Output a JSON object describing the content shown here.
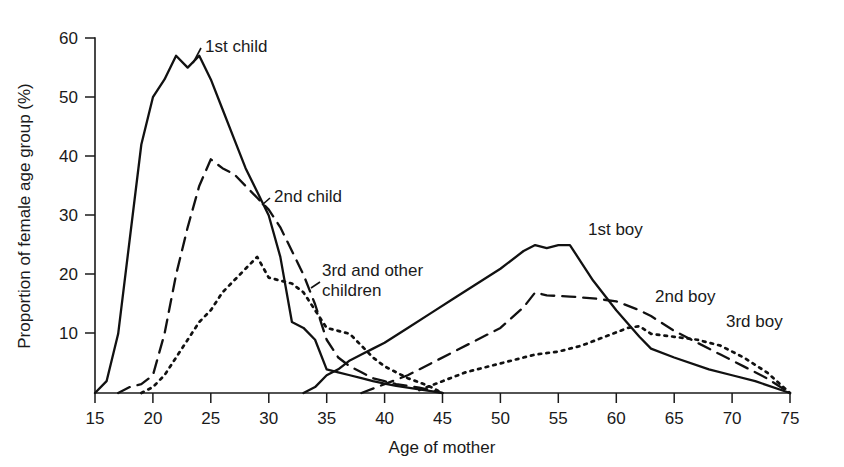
{
  "figure": {
    "background_color": "#ffffff",
    "ink_color": "#111111"
  },
  "axes": {
    "x_title": "Age of mother",
    "y_title": "Proportion of female age group (%)",
    "x_ticks": [
      "15",
      "20",
      "25",
      "30",
      "35",
      "40",
      "45",
      "50",
      "55",
      "60",
      "65",
      "70",
      "75"
    ],
    "y_ticks": [
      "10",
      "20",
      "30",
      "40",
      "50",
      "60"
    ]
  },
  "labels": {
    "first_child": "1st child",
    "second_child": "2nd child",
    "third_children_line1": "3rd and other",
    "third_children_line2": "children",
    "first_boy": "1st boy",
    "second_boy": "2nd boy",
    "third_boy": "3rd boy"
  },
  "chart_data": {
    "type": "line",
    "title": "",
    "xlabel": "Age of mother",
    "ylabel": "Proportion of female age group (%)",
    "xlim": [
      15,
      75
    ],
    "ylim": [
      0,
      60
    ],
    "xticks": [
      15,
      20,
      25,
      30,
      35,
      40,
      45,
      50,
      55,
      60,
      65,
      70,
      75
    ],
    "yticks": [
      10,
      20,
      30,
      40,
      50,
      60
    ],
    "grid": false,
    "legend_position": "inline-annotations",
    "series": [
      {
        "name": "1st child",
        "style": "solid",
        "x": [
          15,
          16,
          17,
          18,
          19,
          20,
          21,
          22,
          23,
          24,
          25,
          26,
          27,
          28,
          29,
          30,
          31,
          32,
          33,
          34,
          35,
          36,
          37,
          38,
          39,
          40,
          41,
          42,
          43,
          44,
          45
        ],
        "y": [
          0,
          2,
          10,
          26,
          42,
          50,
          53,
          57,
          55,
          57,
          53,
          48,
          43,
          38,
          34,
          30,
          23,
          12,
          11,
          9,
          4,
          3.5,
          3,
          2.5,
          2,
          1.6,
          1.2,
          0.9,
          0.6,
          0.3,
          0
        ]
      },
      {
        "name": "2nd child",
        "style": "dashed",
        "x": [
          17,
          18,
          19,
          20,
          21,
          22,
          23,
          24,
          25,
          26,
          27,
          28,
          29,
          30,
          31,
          32,
          33,
          34,
          35,
          36,
          37,
          38,
          39,
          40,
          41,
          42,
          43,
          44,
          45
        ],
        "y": [
          0,
          1,
          1.5,
          3,
          10,
          20,
          28,
          35,
          39.5,
          38,
          37,
          35,
          33,
          31,
          28,
          24,
          20,
          15,
          9,
          6,
          4.5,
          3.5,
          2.5,
          2,
          1.5,
          1.2,
          0.9,
          0.5,
          0
        ]
      },
      {
        "name": "3rd and other children",
        "style": "dotted",
        "x": [
          19,
          20,
          21,
          22,
          23,
          24,
          25,
          26,
          27,
          28,
          29,
          30,
          31,
          32,
          33,
          34,
          35,
          36,
          37,
          38,
          39,
          40,
          41,
          42,
          43,
          44,
          45
        ],
        "y": [
          0,
          1,
          3,
          6,
          9,
          12,
          14,
          17,
          19,
          21,
          23,
          19.5,
          19,
          18.5,
          17,
          14,
          11,
          10.5,
          10,
          8,
          6,
          4.5,
          3.5,
          2.5,
          1.8,
          1,
          0
        ]
      },
      {
        "name": "1st boy",
        "style": "solid",
        "x": [
          33,
          34,
          35,
          36,
          37,
          38,
          39,
          40,
          42,
          44,
          46,
          48,
          50,
          52,
          53,
          54,
          55,
          56,
          57,
          58,
          60,
          62,
          63,
          65,
          68,
          70,
          72,
          75
        ],
        "y": [
          0,
          1,
          3,
          4,
          5.5,
          6.5,
          7.5,
          8.5,
          11,
          13.5,
          16,
          18.5,
          21,
          24,
          25,
          24.5,
          25,
          25,
          22,
          19,
          14,
          9.5,
          7.5,
          6,
          4,
          3,
          2,
          0
        ]
      },
      {
        "name": "2nd boy",
        "style": "dashed",
        "x": [
          38,
          40,
          42,
          44,
          46,
          48,
          50,
          52,
          53,
          54,
          56,
          58,
          60,
          62,
          63,
          65,
          67,
          69,
          71,
          73,
          75
        ],
        "y": [
          0,
          1.5,
          3,
          5,
          7,
          9,
          11,
          14.5,
          17,
          16.5,
          16.3,
          16,
          15.5,
          14,
          13,
          10.5,
          8.5,
          6.5,
          4.5,
          2.5,
          0
        ]
      },
      {
        "name": "3rd boy",
        "style": "dotted",
        "x": [
          43,
          45,
          47,
          49,
          51,
          53,
          55,
          57,
          59,
          61,
          62,
          63,
          65,
          67,
          69,
          71,
          73,
          75
        ],
        "y": [
          0.5,
          2,
          3.5,
          4.5,
          5.5,
          6.5,
          7,
          8,
          9.5,
          11,
          11.3,
          10,
          9.5,
          9,
          8,
          6,
          3.5,
          0
        ]
      }
    ]
  }
}
